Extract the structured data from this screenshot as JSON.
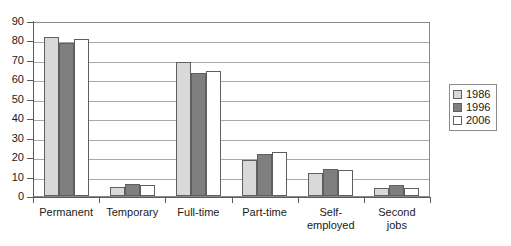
{
  "chart_data": {
    "type": "bar",
    "title": "",
    "subtitle": "",
    "xlabel": "",
    "ylabel": "",
    "ylim": [
      0,
      90
    ],
    "ytick_step": 10,
    "yticks": [
      "0",
      "10",
      "20",
      "30",
      "40",
      "50",
      "60",
      "70",
      "80",
      "90"
    ],
    "grid": "horizontal",
    "legend_position": "right",
    "categories": [
      "Permanent",
      "Temporary",
      "Full-time",
      "Part-time",
      "Self-\nemployed",
      "Second\njobs"
    ],
    "series": [
      {
        "name": "1986",
        "color": "#d9d9d9",
        "values": [
          82,
          4.5,
          68.7,
          18.5,
          11.8,
          4
        ]
      },
      {
        "name": "1996",
        "color": "#7f7f7f",
        "values": [
          78.5,
          6,
          63.5,
          21.5,
          13.8,
          5.5
        ]
      },
      {
        "name": "2006",
        "color": "#ffffff",
        "values": [
          81,
          5.5,
          64.3,
          22.5,
          13.3,
          4
        ]
      }
    ]
  },
  "legend": {
    "items": [
      {
        "label": "1986",
        "swatch": "legend-swatch-1986"
      },
      {
        "label": "1996",
        "swatch": "legend-swatch-1996"
      },
      {
        "label": "2006",
        "swatch": "legend-swatch-2006"
      }
    ]
  },
  "colors": {
    "series_1986": "#d9d9d9",
    "series_1996": "#7f7f7f",
    "series_2006": "#ffffff",
    "bar_outline": "#5f5f5f",
    "gridline": "#a8a8a8",
    "axis": "#5a5a5a",
    "text": "#1a1a1a",
    "background": "#ffffff"
  }
}
